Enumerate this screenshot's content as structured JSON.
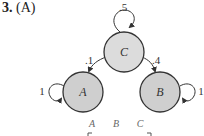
{
  "problem": {
    "number": "3.",
    "part": "(A)"
  },
  "diagram": {
    "nodes": [
      {
        "id": "C",
        "label": "C",
        "self_loop": ".5"
      },
      {
        "id": "A",
        "label": "A",
        "self_loop": "1"
      },
      {
        "id": "B",
        "label": "B",
        "self_loop": "1"
      }
    ],
    "edges": [
      {
        "from": "C",
        "to": "A",
        "label": ".1"
      },
      {
        "from": "C",
        "to": "B",
        "label": ".4"
      }
    ],
    "colors": {
      "node_c_fill": "#dcdcdc",
      "node_ab_fill": "#cfcfcf",
      "stroke": "#333333"
    }
  },
  "matrix": {
    "column_headers": [
      "A",
      "B",
      "C"
    ]
  }
}
